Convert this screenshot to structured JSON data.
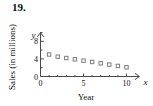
{
  "exercise": {
    "number_label": "19."
  },
  "chart_data": {
    "type": "scatter",
    "title": "",
    "xlabel": "Year",
    "ylabel": "Sales (in millions)",
    "x_variable_symbol": "x",
    "y_variable_symbol": "y",
    "x": [
      1,
      2,
      3,
      4,
      5,
      6,
      7,
      8,
      9,
      10
    ],
    "values": [
      5.0,
      4.5,
      4.2,
      3.9,
      3.6,
      3.3,
      3.0,
      2.7,
      2.4,
      2.1
    ],
    "xlim": [
      0,
      11.5
    ],
    "ylim": [
      0,
      10
    ],
    "x_ticks_major": [
      0,
      5,
      10
    ],
    "x_tick_labels": [
      "0",
      "5",
      "10"
    ],
    "x_ticks_minor": [
      1,
      2,
      3,
      4,
      6,
      7,
      8,
      9
    ],
    "y_ticks_major": [
      0,
      4,
      8
    ],
    "y_tick_labels": [
      "0",
      "4",
      "8"
    ],
    "y_ticks_minor": [
      2,
      6,
      10
    ],
    "grid": false,
    "legend": false,
    "marker_shape": "open-square",
    "marker_color": "#7d7d7d"
  },
  "colors": {
    "axis": "#4a4a4a",
    "marker_stroke": "#7d7d7d",
    "text": "#0d0d0d",
    "background": "#ffffff"
  }
}
